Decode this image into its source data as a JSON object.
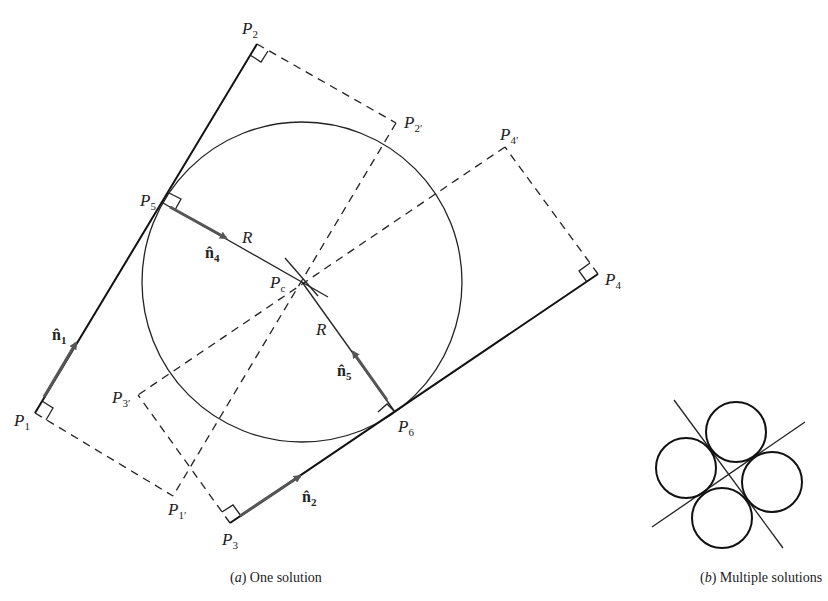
{
  "figure_a": {
    "caption_letter": "a",
    "caption_text": " One solution",
    "points": {
      "P1": {
        "label": "P",
        "sub": "1"
      },
      "P2": {
        "label": "P",
        "sub": "2"
      },
      "P3": {
        "label": "P",
        "sub": "3"
      },
      "P4": {
        "label": "P",
        "sub": "4"
      },
      "P5": {
        "label": "P",
        "sub": "5"
      },
      "P6": {
        "label": "P",
        "sub": "6"
      },
      "Pc": {
        "label": "P",
        "sub": "c"
      },
      "P1p": {
        "label": "P",
        "sub": "1′"
      },
      "P2p": {
        "label": "P",
        "sub": "2′"
      },
      "P3p": {
        "label": "P",
        "sub": "3′"
      },
      "P4p": {
        "label": "P",
        "sub": "4′"
      }
    },
    "radius_label": "R",
    "vectors": {
      "n1": {
        "label": "n̂",
        "sub": "1"
      },
      "n2": {
        "label": "n̂",
        "sub": "2"
      },
      "n4": {
        "label": "n̂",
        "sub": "4"
      },
      "n5": {
        "label": "n̂",
        "sub": "5"
      }
    }
  },
  "figure_b": {
    "caption_letter": "b",
    "caption_text": " Multiple solutions"
  },
  "colors": {
    "line": "#111111",
    "arrow": "#555555",
    "background": "#ffffff"
  }
}
